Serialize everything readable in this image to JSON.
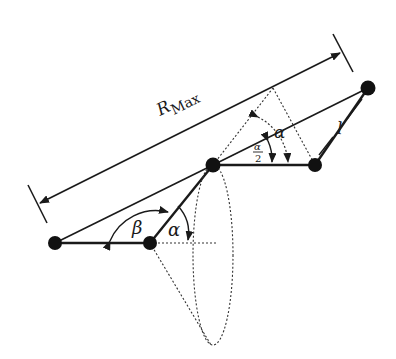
{
  "diagram": {
    "title": "",
    "colors": {
      "line": "#1a1a1a",
      "node": "#111111",
      "dotted": "#333333",
      "background": "#ffffff"
    },
    "labels": {
      "r_max_main": "R",
      "r_max_sub": "Max",
      "beta": "β",
      "alpha_lower": "α",
      "alpha_upper": "α",
      "alpha_half_num": "α",
      "alpha_half_den": "2",
      "link_length": "l"
    },
    "nodes": [
      {
        "id": "joint-1",
        "x": 55,
        "y": 243
      },
      {
        "id": "joint-2",
        "x": 150,
        "y": 243
      },
      {
        "id": "joint-3",
        "x": 213,
        "y": 165
      },
      {
        "id": "joint-4",
        "x": 315,
        "y": 165
      },
      {
        "id": "end-effector",
        "x": 368,
        "y": 88
      }
    ]
  }
}
